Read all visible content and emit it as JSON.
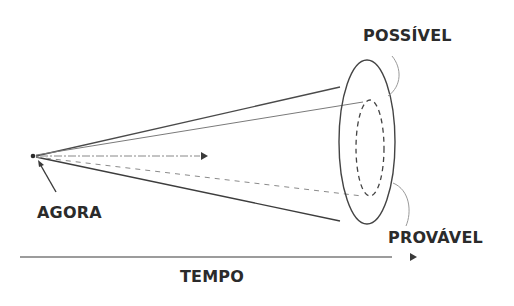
{
  "diagram": {
    "type": "futures-cone",
    "labels": {
      "now": "AGORA",
      "possible": "POSSÍVEL",
      "probable": "PROVÁVEL",
      "time": "TEMPO"
    },
    "colors": {
      "background": "#ffffff",
      "ink": "#2b2b2b",
      "light_line": "#8a8a8a"
    }
  }
}
